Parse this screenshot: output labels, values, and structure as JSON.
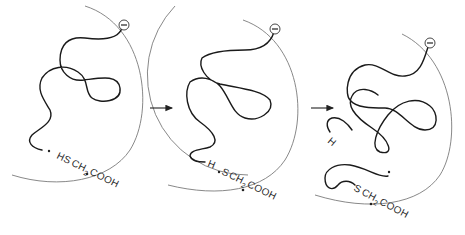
{
  "figure": {
    "panels": [
      {
        "id": 1,
        "charge_symbol": "−",
        "label_parts": [
          "HS",
          "CH",
          "2",
          "COOH"
        ],
        "label_text": "HSCH2COOH"
      },
      {
        "id": 2,
        "charge_symbol": "−",
        "h_label": "H",
        "label_parts": [
          "S",
          "CH",
          "2",
          "COOH"
        ],
        "label_text": "H·SCH2COOH"
      },
      {
        "id": 3,
        "charge_symbol": "−",
        "h_label": "H",
        "label_parts": [
          "S",
          "CH",
          "2",
          "COOH"
        ],
        "label_text": "SCH2COOH"
      }
    ],
    "arrows": [
      {
        "from": 1,
        "to": 2,
        "symbol": "→"
      },
      {
        "from": 2,
        "to": 3,
        "symbol": "→"
      }
    ]
  }
}
